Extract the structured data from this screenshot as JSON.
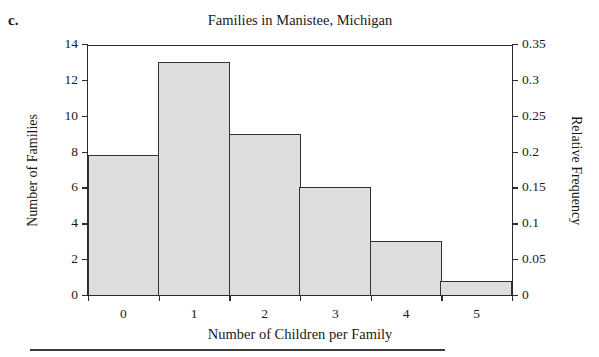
{
  "figure_label": "c.",
  "chart_data": {
    "type": "bar",
    "title": "Families in Manistee, Michigan",
    "xlabel": "Number of Children per Family",
    "ylabel": "Number of Families",
    "y2label": "Relative Frequency",
    "categories": [
      "0",
      "1",
      "2",
      "3",
      "4",
      "5"
    ],
    "values": [
      7.8,
      13,
      9,
      6,
      3,
      0.8
    ],
    "ylim": [
      0,
      14
    ],
    "yticks": [
      0,
      2,
      4,
      6,
      8,
      10,
      12,
      14
    ],
    "ytick_labels": [
      "0",
      "2",
      "4",
      "6",
      "8",
      "10",
      "12",
      "14"
    ],
    "y2lim": [
      0,
      0.35
    ],
    "y2ticks": [
      0,
      0.05,
      0.1,
      0.15,
      0.2,
      0.25,
      0.3,
      0.35
    ],
    "y2tick_labels": [
      "0",
      "0.05",
      "0.1",
      "0.15",
      "0.2",
      "0.25",
      "0.3",
      "0.35"
    ],
    "xtick_labels": [
      "0",
      "1",
      "2",
      "3",
      "4",
      "5"
    ],
    "grid": false,
    "legend": "none",
    "bar_fill_color": "#dedede",
    "bar_edge_color": "#333333",
    "axis_color": "#2b2b2b"
  }
}
